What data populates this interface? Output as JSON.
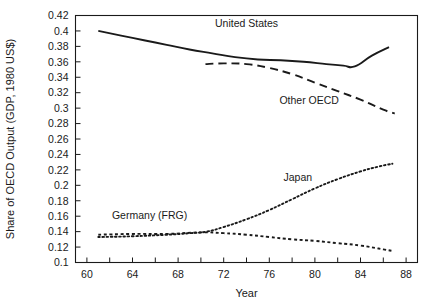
{
  "chart_data": {
    "type": "line",
    "title": "",
    "xlabel": "Year",
    "ylabel": "Share of OECD Output (GDP, 1980 US$)",
    "xlim": [
      59,
      89
    ],
    "ylim": [
      0.1,
      0.42
    ],
    "grid": false,
    "legend": "inline-labels",
    "xticks": [
      60,
      62,
      64,
      66,
      68,
      70,
      72,
      74,
      76,
      78,
      80,
      82,
      84,
      86,
      88
    ],
    "xticklabels": [
      "60",
      "",
      "64",
      "",
      "68",
      "",
      "72",
      "",
      "76",
      "",
      "80",
      "",
      "84",
      "",
      "88"
    ],
    "yticks": [
      0.1,
      0.12,
      0.14,
      0.16,
      0.18,
      0.2,
      0.22,
      0.24,
      0.26,
      0.28,
      0.3,
      0.32,
      0.34,
      0.36,
      0.38,
      0.4,
      0.42
    ],
    "yticklabels": [
      "0.1",
      "0.12",
      "0.14",
      "0.16",
      "0.18",
      "0.2",
      "0.22",
      "0.24",
      "0.26",
      "0.28",
      "0.3",
      "0.32",
      "0.34",
      "0.36",
      "0.38",
      "0.4",
      "0.42"
    ],
    "series": [
      {
        "name": "United States",
        "style": "solid",
        "label_x": 74,
        "label_y": 0.405,
        "x": [
          61.0,
          63,
          65,
          67,
          69,
          71,
          73,
          75,
          77,
          79,
          81,
          82.5,
          83.5,
          85,
          86.5
        ],
        "values": [
          0.4,
          0.394,
          0.388,
          0.382,
          0.376,
          0.371,
          0.366,
          0.363,
          0.362,
          0.36,
          0.357,
          0.355,
          0.354,
          0.368,
          0.379
        ]
      },
      {
        "name": "Other OECD",
        "style": "dashed",
        "label_x": 79.5,
        "label_y": 0.305,
        "x": [
          70.4,
          72,
          74,
          76,
          78,
          80,
          82,
          84,
          86,
          87.0
        ],
        "values": [
          0.357,
          0.358,
          0.357,
          0.352,
          0.344,
          0.333,
          0.322,
          0.311,
          0.298,
          0.293
        ]
      },
      {
        "name": "Japan",
        "style": "dotted",
        "label_x": 78.5,
        "label_y": 0.205,
        "x": [
          61.0,
          64,
          67,
          69,
          70.5,
          72,
          74,
          76,
          78,
          80,
          82,
          84,
          85.5,
          86.8
        ],
        "values": [
          0.133,
          0.134,
          0.136,
          0.138,
          0.14,
          0.146,
          0.156,
          0.168,
          0.182,
          0.196,
          0.208,
          0.218,
          0.224,
          0.228
        ]
      },
      {
        "name": "Germany (FRG)",
        "style": "dashed-fine",
        "label_x": 65.5,
        "label_y": 0.157,
        "x": [
          61.0,
          64,
          67,
          70,
          72,
          74,
          76,
          78,
          80,
          82,
          84,
          86,
          86.8
        ],
        "values": [
          0.136,
          0.137,
          0.137,
          0.139,
          0.138,
          0.136,
          0.133,
          0.13,
          0.128,
          0.125,
          0.122,
          0.117,
          0.115
        ]
      }
    ]
  },
  "colors": {
    "ink": "#1a1a1a",
    "background": "#ffffff"
  }
}
